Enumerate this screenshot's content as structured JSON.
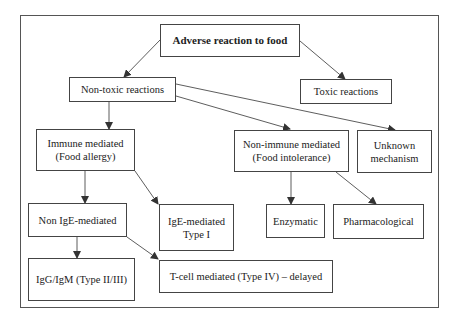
{
  "diagram": {
    "type": "flowchart",
    "title": "Adverse reaction to food",
    "nodes": [
      {
        "id": "root",
        "label": "Adverse reaction to food"
      },
      {
        "id": "non_toxic",
        "label": "Non-toxic reactions"
      },
      {
        "id": "toxic",
        "label": "Toxic reactions"
      },
      {
        "id": "immune",
        "label": "Immune mediated\n(Food allergy)"
      },
      {
        "id": "non_immune",
        "label": "Non-immune mediated\n(Food intolerance)"
      },
      {
        "id": "unknown",
        "label": "Unknown\nmechanism"
      },
      {
        "id": "non_ige",
        "label": "Non IgE-mediated"
      },
      {
        "id": "ige",
        "label": "IgE-mediated\nType I"
      },
      {
        "id": "enzymatic",
        "label": "Enzymatic"
      },
      {
        "id": "pharmacological",
        "label": "Pharmacological"
      },
      {
        "id": "igg_igm",
        "label": "IgG/IgM (Type II/III)"
      },
      {
        "id": "tcell",
        "label": "T-cell mediated (Type IV) – delayed"
      }
    ],
    "edges": [
      {
        "from": "root",
        "to": "non_toxic"
      },
      {
        "from": "root",
        "to": "toxic"
      },
      {
        "from": "non_toxic",
        "to": "immune"
      },
      {
        "from": "non_toxic",
        "to": "non_immune"
      },
      {
        "from": "non_toxic",
        "to": "unknown"
      },
      {
        "from": "immune",
        "to": "non_ige"
      },
      {
        "from": "immune",
        "to": "ige"
      },
      {
        "from": "non_immune",
        "to": "enzymatic"
      },
      {
        "from": "non_immune",
        "to": "pharmacological"
      },
      {
        "from": "non_ige",
        "to": "igg_igm"
      },
      {
        "from": "non_ige",
        "to": "tcell"
      }
    ],
    "colors": {
      "border": "#444444",
      "arrow": "#333333",
      "text": "#222222",
      "background": "#ffffff"
    }
  }
}
